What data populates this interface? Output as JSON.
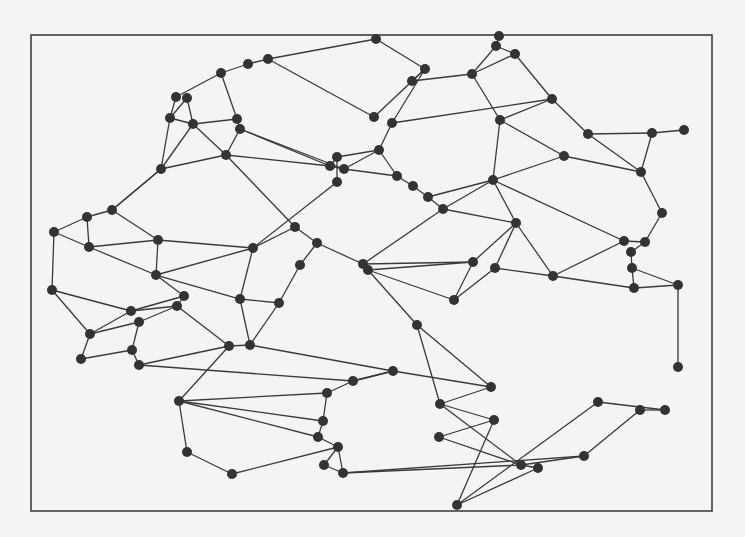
{
  "diagram": {
    "type": "planar-graph",
    "frame": {
      "x": 31,
      "y": 35,
      "width": 681,
      "height": 476,
      "stroke": "#333333"
    },
    "style": {
      "edge_color": "#3a3a3a",
      "node_color": "#333333",
      "node_radius": 5,
      "background": "#f4f4f2"
    },
    "nodes": [
      [
        376,
        39
      ],
      [
        499,
        36
      ],
      [
        496,
        46
      ],
      [
        515,
        54
      ],
      [
        472,
        74
      ],
      [
        425,
        69
      ],
      [
        412,
        81
      ],
      [
        268,
        59
      ],
      [
        248,
        64
      ],
      [
        221,
        73
      ],
      [
        176,
        97
      ],
      [
        187,
        98
      ],
      [
        170,
        118
      ],
      [
        193,
        124
      ],
      [
        237,
        119
      ],
      [
        240,
        129
      ],
      [
        226,
        155
      ],
      [
        161,
        169
      ],
      [
        374,
        117
      ],
      [
        392,
        123
      ],
      [
        379,
        150
      ],
      [
        337,
        157
      ],
      [
        330,
        166
      ],
      [
        344,
        169
      ],
      [
        337,
        182
      ],
      [
        397,
        176
      ],
      [
        413,
        186
      ],
      [
        428,
        197
      ],
      [
        443,
        209
      ],
      [
        552,
        99
      ],
      [
        500,
        120
      ],
      [
        588,
        134
      ],
      [
        652,
        133
      ],
      [
        684,
        130
      ],
      [
        564,
        156
      ],
      [
        641,
        172
      ],
      [
        493,
        180
      ],
      [
        662,
        213
      ],
      [
        112,
        210
      ],
      [
        87,
        217
      ],
      [
        54,
        232
      ],
      [
        89,
        247
      ],
      [
        158,
        240
      ],
      [
        156,
        275
      ],
      [
        253,
        248
      ],
      [
        52,
        290
      ],
      [
        131,
        311
      ],
      [
        184,
        296
      ],
      [
        177,
        306
      ],
      [
        139,
        322
      ],
      [
        240,
        299
      ],
      [
        279,
        303
      ],
      [
        90,
        334
      ],
      [
        81,
        359
      ],
      [
        132,
        350
      ],
      [
        229,
        346
      ],
      [
        250,
        345
      ],
      [
        139,
        365
      ],
      [
        295,
        227
      ],
      [
        317,
        243
      ],
      [
        300,
        265
      ],
      [
        363,
        264
      ],
      [
        368,
        270
      ],
      [
        473,
        262
      ],
      [
        454,
        300
      ],
      [
        417,
        325
      ],
      [
        516,
        223
      ],
      [
        495,
        268
      ],
      [
        553,
        276
      ],
      [
        624,
        241
      ],
      [
        645,
        242
      ],
      [
        631,
        252
      ],
      [
        632,
        268
      ],
      [
        634,
        288
      ],
      [
        678,
        285
      ],
      [
        678,
        367
      ],
      [
        179,
        401
      ],
      [
        187,
        452
      ],
      [
        232,
        474
      ],
      [
        327,
        393
      ],
      [
        323,
        421
      ],
      [
        318,
        437
      ],
      [
        338,
        447
      ],
      [
        324,
        465
      ],
      [
        343,
        473
      ],
      [
        353,
        381
      ],
      [
        393,
        371
      ],
      [
        491,
        387
      ],
      [
        440,
        404
      ],
      [
        494,
        420
      ],
      [
        439,
        437
      ],
      [
        521,
        465
      ],
      [
        538,
        468
      ],
      [
        457,
        505
      ],
      [
        598,
        402
      ],
      [
        584,
        456
      ],
      [
        640,
        410
      ],
      [
        665,
        410
      ]
    ],
    "edges": [
      [
        0,
        5
      ],
      [
        0,
        7
      ],
      [
        7,
        8
      ],
      [
        8,
        9
      ],
      [
        9,
        10
      ],
      [
        9,
        14
      ],
      [
        10,
        12
      ],
      [
        11,
        13
      ],
      [
        11,
        12
      ],
      [
        12,
        13
      ],
      [
        12,
        17
      ],
      [
        13,
        14
      ],
      [
        13,
        17
      ],
      [
        13,
        16
      ],
      [
        14,
        15
      ],
      [
        15,
        16
      ],
      [
        15,
        22
      ],
      [
        15,
        23
      ],
      [
        16,
        17
      ],
      [
        16,
        22
      ],
      [
        16,
        58
      ],
      [
        17,
        38
      ],
      [
        7,
        18
      ],
      [
        18,
        5
      ],
      [
        19,
        5
      ],
      [
        19,
        20
      ],
      [
        19,
        29
      ],
      [
        20,
        21
      ],
      [
        20,
        23
      ],
      [
        20,
        25
      ],
      [
        21,
        22
      ],
      [
        21,
        24
      ],
      [
        22,
        23
      ],
      [
        23,
        25
      ],
      [
        24,
        44
      ],
      [
        25,
        26
      ],
      [
        26,
        27
      ],
      [
        27,
        28
      ],
      [
        27,
        36
      ],
      [
        28,
        36
      ],
      [
        28,
        61
      ],
      [
        28,
        66
      ],
      [
        5,
        6
      ],
      [
        4,
        6
      ],
      [
        4,
        2
      ],
      [
        4,
        3
      ],
      [
        1,
        2
      ],
      [
        2,
        3
      ],
      [
        3,
        29
      ],
      [
        4,
        30
      ],
      [
        29,
        30
      ],
      [
        29,
        31
      ],
      [
        30,
        36
      ],
      [
        30,
        34
      ],
      [
        31,
        32
      ],
      [
        32,
        33
      ],
      [
        31,
        35
      ],
      [
        32,
        35
      ],
      [
        34,
        35
      ],
      [
        34,
        36
      ],
      [
        35,
        37
      ],
      [
        37,
        70
      ],
      [
        36,
        66
      ],
      [
        36,
        69
      ],
      [
        66,
        67
      ],
      [
        66,
        68
      ],
      [
        66,
        63
      ],
      [
        63,
        61
      ],
      [
        63,
        62
      ],
      [
        63,
        64
      ],
      [
        62,
        64
      ],
      [
        62,
        65
      ],
      [
        64,
        67
      ],
      [
        67,
        68
      ],
      [
        68,
        69
      ],
      [
        68,
        73
      ],
      [
        69,
        70
      ],
      [
        70,
        71
      ],
      [
        71,
        72
      ],
      [
        72,
        73
      ],
      [
        72,
        74
      ],
      [
        73,
        74
      ],
      [
        74,
        75
      ],
      [
        75,
        99
      ],
      [
        99,
        98
      ],
      [
        98,
        97
      ],
      [
        97,
        96
      ],
      [
        17,
        38
      ],
      [
        38,
        39
      ],
      [
        39,
        40
      ],
      [
        39,
        41
      ],
      [
        38,
        42
      ],
      [
        40,
        41
      ],
      [
        40,
        45
      ],
      [
        41,
        42
      ],
      [
        41,
        43
      ],
      [
        42,
        43
      ],
      [
        42,
        44
      ],
      [
        43,
        44
      ],
      [
        43,
        47
      ],
      [
        43,
        50
      ],
      [
        44,
        58
      ],
      [
        44,
        50
      ],
      [
        58,
        59
      ],
      [
        59,
        60
      ],
      [
        60,
        51
      ],
      [
        59,
        61
      ],
      [
        45,
        46
      ],
      [
        45,
        52
      ],
      [
        46,
        47
      ],
      [
        46,
        48
      ],
      [
        46,
        52
      ],
      [
        47,
        48
      ],
      [
        48,
        49
      ],
      [
        49,
        52
      ],
      [
        49,
        54
      ],
      [
        48,
        55
      ],
      [
        50,
        51
      ],
      [
        50,
        56
      ],
      [
        51,
        56
      ],
      [
        55,
        56
      ],
      [
        52,
        53
      ],
      [
        53,
        54
      ],
      [
        54,
        57
      ],
      [
        55,
        57
      ],
      [
        55,
        76
      ],
      [
        57,
        85
      ],
      [
        56,
        86
      ],
      [
        86,
        87
      ],
      [
        86,
        85
      ],
      [
        65,
        87
      ],
      [
        65,
        88
      ],
      [
        87,
        88
      ],
      [
        88,
        89
      ],
      [
        88,
        91
      ],
      [
        89,
        90
      ],
      [
        89,
        93
      ],
      [
        90,
        91
      ],
      [
        90,
        98
      ],
      [
        91,
        92
      ],
      [
        91,
        95
      ],
      [
        92,
        93
      ],
      [
        93,
        94
      ],
      [
        94,
        97
      ],
      [
        95,
        96
      ],
      [
        96,
        98
      ],
      [
        76,
        77
      ],
      [
        77,
        78
      ],
      [
        78,
        82
      ],
      [
        76,
        79
      ],
      [
        76,
        80
      ],
      [
        76,
        81
      ],
      [
        79,
        80
      ],
      [
        80,
        81
      ],
      [
        81,
        82
      ],
      [
        82,
        83
      ],
      [
        82,
        84
      ],
      [
        83,
        84
      ],
      [
        84,
        91
      ],
      [
        79,
        85
      ],
      [
        85,
        86
      ],
      [
        84,
        95
      ]
    ]
  }
}
